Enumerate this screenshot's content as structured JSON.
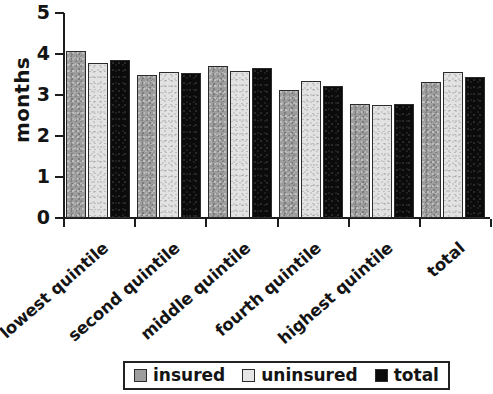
{
  "chart_data": {
    "type": "bar",
    "title": "",
    "subtitle": "",
    "xlabel": "",
    "ylabel": "months",
    "ylim": [
      0,
      5
    ],
    "yticks": [
      "0",
      "1",
      "2",
      "3",
      "4",
      "5"
    ],
    "grid": false,
    "legend_position": "bottom-center",
    "categories": [
      "lowest quintile",
      "second quintile",
      "middle quintile",
      "fourth quintile",
      "highest quintile",
      "total"
    ],
    "series": [
      {
        "name": "insured",
        "color": "#9d9d9d",
        "values": [
          4.07,
          3.5,
          3.7,
          3.12,
          2.78,
          3.32
        ]
      },
      {
        "name": "uninsured",
        "color": "#e2e2e2",
        "values": [
          3.78,
          3.57,
          3.58,
          3.35,
          2.76,
          3.55
        ]
      },
      {
        "name": "total",
        "color": "#0b0b0b",
        "values": [
          3.85,
          3.53,
          3.65,
          3.22,
          2.78,
          3.45
        ]
      }
    ]
  },
  "axis": {
    "y_label": "months",
    "y_ticks": [
      {
        "value": 5,
        "label": "5"
      },
      {
        "value": 4,
        "label": "4"
      },
      {
        "value": 3,
        "label": "3"
      },
      {
        "value": 2,
        "label": "2"
      },
      {
        "value": 1,
        "label": "1"
      },
      {
        "value": 0,
        "label": "0"
      }
    ]
  },
  "legend": {
    "items": [
      {
        "label": "insured",
        "swatch": "insured-swatch"
      },
      {
        "label": "uninsured",
        "swatch": "uninsured-swatch"
      },
      {
        "label": "total",
        "swatch": "total-swatch"
      }
    ]
  }
}
